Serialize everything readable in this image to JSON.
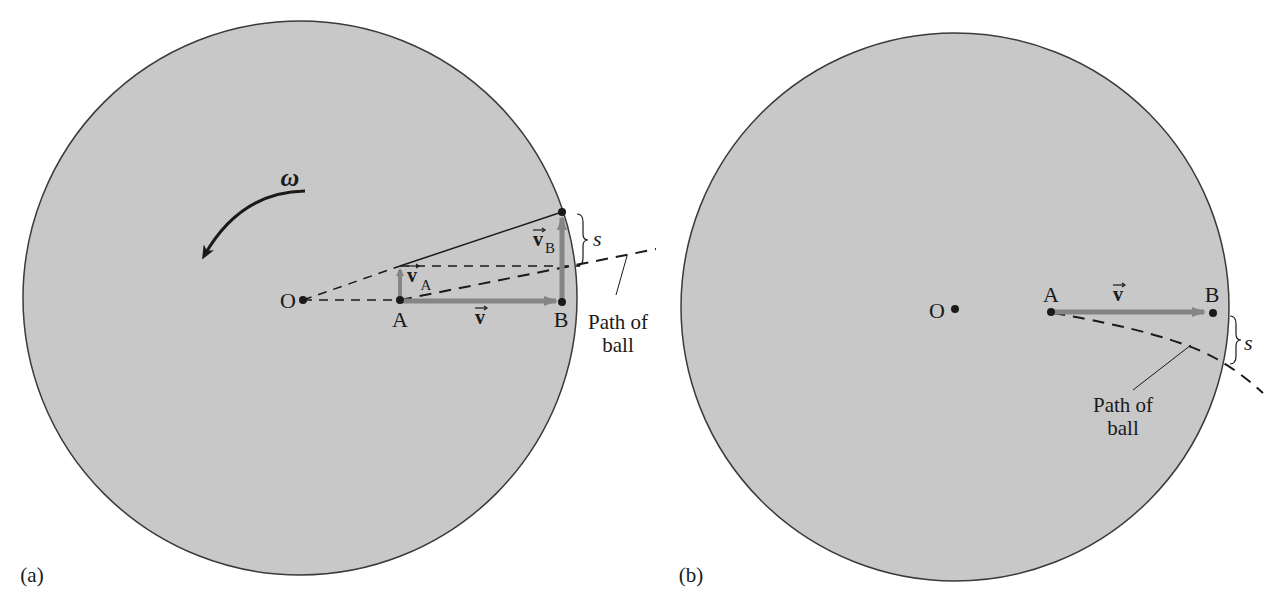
{
  "figure_a": {
    "panel_label": "(a)",
    "center_label": "O",
    "point_a_label": "A",
    "point_b_label": "B",
    "velocity_label": "v",
    "velocity_a_label": "v",
    "velocity_a_sub": "A",
    "velocity_b_label": "v",
    "velocity_b_sub": "B",
    "angular_velocity_label": "ω",
    "displacement_label": "s",
    "path_label_line1": "Path of",
    "path_label_line2": "ball"
  },
  "figure_b": {
    "panel_label": "(b)",
    "center_label": "O",
    "point_a_label": "A",
    "point_b_label": "B",
    "velocity_label": "v",
    "displacement_label": "s",
    "path_label_line1": "Path of",
    "path_label_line2": "ball"
  },
  "colors": {
    "disk_fill": "#c8c8c8",
    "disk_stroke": "#3a3a3a",
    "vector_gray": "#858585",
    "ink": "#1a1a1a"
  }
}
